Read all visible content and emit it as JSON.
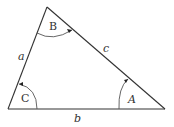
{
  "diagram": {
    "type": "triangle",
    "vertices": [
      {
        "name": "B",
        "label": "B",
        "x": 47,
        "y": 7
      },
      {
        "name": "C",
        "label": "C",
        "x": 8,
        "y": 109
      },
      {
        "name": "A",
        "label": "A",
        "x": 165,
        "y": 109
      }
    ],
    "sides": [
      {
        "name": "a",
        "label": "a",
        "between": [
          "B",
          "C"
        ]
      },
      {
        "name": "b",
        "label": "b",
        "between": [
          "C",
          "A"
        ]
      },
      {
        "name": "c",
        "label": "c",
        "between": [
          "B",
          "A"
        ]
      }
    ],
    "angle_labels": {
      "A": "A",
      "B": "B",
      "C": "C"
    },
    "side_labels": {
      "a": "a",
      "b": "b",
      "c": "c"
    },
    "colors": {
      "stroke": "#333333",
      "arc": "#555555",
      "background": "#ffffff"
    }
  }
}
